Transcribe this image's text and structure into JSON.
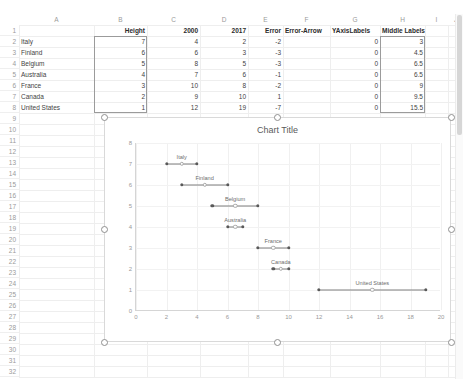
{
  "spreadsheet": {
    "column_headers": [
      "A",
      "B",
      "C",
      "D",
      "E",
      "F",
      "G",
      "H",
      "I",
      "J"
    ],
    "row_numbers": [
      "1",
      "2",
      "3",
      "4",
      "5",
      "6",
      "7",
      "8",
      "9",
      "10",
      "11",
      "12",
      "13",
      "14",
      "15",
      "16",
      "17",
      "18",
      "19",
      "20",
      "21",
      "22",
      "23",
      "24",
      "25",
      "26",
      "27",
      "28",
      "29",
      "30",
      "31",
      "32"
    ],
    "table_headers": {
      "A1": "",
      "B1": "Height",
      "C1": "2000",
      "D1": "2017",
      "E1": "Error",
      "F1": "Error-Arrow",
      "G1": "YAxisLabels",
      "H1": "Middle Labels"
    },
    "rows": [
      {
        "row": "2",
        "name": "Italy",
        "height": "7",
        "y2000": "4",
        "y2017": "2",
        "error": "-2",
        "error_arrow": "",
        "yaxislabels": "0",
        "middle_labels": "3"
      },
      {
        "row": "3",
        "name": "Finland",
        "height": "6",
        "y2000": "6",
        "y2017": "3",
        "error": "-3",
        "error_arrow": "",
        "yaxislabels": "0",
        "middle_labels": "4.5"
      },
      {
        "row": "4",
        "name": "Belgium",
        "height": "5",
        "y2000": "8",
        "y2017": "5",
        "error": "-3",
        "error_arrow": "",
        "yaxislabels": "0",
        "middle_labels": "6.5"
      },
      {
        "row": "5",
        "name": "Australia",
        "height": "4",
        "y2000": "7",
        "y2017": "6",
        "error": "-1",
        "error_arrow": "",
        "yaxislabels": "0",
        "middle_labels": "6.5"
      },
      {
        "row": "6",
        "name": "France",
        "height": "3",
        "y2000": "10",
        "y2017": "8",
        "error": "-2",
        "error_arrow": "",
        "yaxislabels": "0",
        "middle_labels": "9"
      },
      {
        "row": "7",
        "name": "Canada",
        "height": "2",
        "y2000": "9",
        "y2017": "10",
        "error": "1",
        "error_arrow": "",
        "yaxislabels": "0",
        "middle_labels": "9.5"
      },
      {
        "row": "8",
        "name": "United States",
        "height": "1",
        "y2000": "12",
        "y2017": "19",
        "error": "-7",
        "error_arrow": "",
        "yaxislabels": "0",
        "middle_labels": "15.5"
      }
    ]
  },
  "chart": {
    "title": "Chart Title",
    "selected": true
  },
  "chart_data": {
    "type": "scatter",
    "title": "Chart Title",
    "xlabel": "",
    "ylabel": "",
    "xlim": [
      0,
      20
    ],
    "ylim": [
      0,
      8
    ],
    "xticks": [
      "0",
      "2",
      "4",
      "6",
      "8",
      "10",
      "12",
      "14",
      "16",
      "18",
      "20"
    ],
    "yticks": [
      "0",
      "1",
      "2",
      "3",
      "4",
      "5",
      "6",
      "7",
      "8"
    ],
    "grid": true,
    "legend": "none",
    "series": [
      {
        "name": "2000",
        "values": [
          4,
          6,
          8,
          7,
          10,
          9,
          12
        ]
      },
      {
        "name": "2017",
        "values": [
          2,
          3,
          5,
          6,
          8,
          10,
          19
        ]
      },
      {
        "name": "Middle Labels",
        "values": [
          3,
          4.5,
          6.5,
          6.5,
          9,
          9.5,
          15.5
        ]
      }
    ],
    "categories": [
      "Italy",
      "Finland",
      "Belgium",
      "Australia",
      "France",
      "Canada",
      "United States"
    ],
    "y_positions": [
      7,
      6,
      5,
      4,
      3,
      2,
      1
    ],
    "points": [
      {
        "label": "Italy",
        "y": 7,
        "x_start": 4,
        "x_end": 2,
        "x_mid": 3
      },
      {
        "label": "Finland",
        "y": 6,
        "x_start": 6,
        "x_end": 3,
        "x_mid": 4.5
      },
      {
        "label": "Belgium",
        "y": 5,
        "x_start": 8,
        "x_end": 5,
        "x_mid": 6.5
      },
      {
        "label": "Australia",
        "y": 4,
        "x_start": 7,
        "x_end": 6,
        "x_mid": 6.5
      },
      {
        "label": "France",
        "y": 3,
        "x_start": 10,
        "x_end": 8,
        "x_mid": 9
      },
      {
        "label": "Canada",
        "y": 2,
        "x_start": 9,
        "x_end": 10,
        "x_mid": 9.5
      },
      {
        "label": "United States",
        "y": 1,
        "x_start": 12,
        "x_end": 19,
        "x_mid": 15.5
      }
    ]
  },
  "colors": {
    "grid": "#eeeeee",
    "header_text": "#9a9a9a",
    "cell_text": "#3f3f3f",
    "dot": "#595959",
    "line": "#7f7f7f",
    "chart_border": "#d9d9d9",
    "title_text": "#5a5a5a"
  }
}
